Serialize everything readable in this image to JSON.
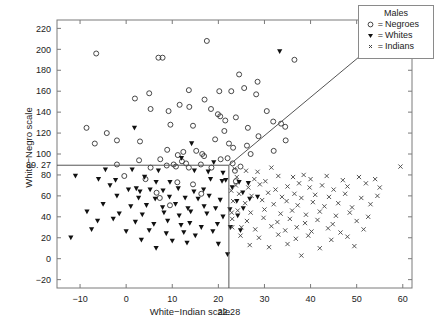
{
  "figure": {
    "axis": {
      "x": {
        "label": "White−Indian scale",
        "min": -15,
        "max": 62,
        "ticks": [
          -10,
          0,
          10,
          20,
          30,
          40,
          50,
          60
        ],
        "tick_labels": [
          "−10",
          "0",
          "10",
          "20",
          "30",
          "40",
          "50",
          "60"
        ],
        "special_tick": 22.28,
        "special_tick_label": "22.28"
      },
      "y": {
        "label": "White−Negro scale",
        "min": -28,
        "max": 228,
        "ticks": [
          -20,
          0,
          20,
          40,
          60,
          80,
          100,
          120,
          140,
          160,
          180,
          200,
          220
        ],
        "tick_labels": [
          "−20",
          "0",
          "20",
          "40",
          "60",
          "80",
          "100",
          "120",
          "140",
          "160",
          "180",
          "200",
          "220"
        ],
        "special_tick": 89.27,
        "special_tick_label": "89. 27"
      },
      "grid": false
    },
    "legend": {
      "title": "Males",
      "position": "top-right",
      "entries": [
        {
          "marker": "circle-open-marker",
          "eq": "=",
          "label": "Negroes"
        },
        {
          "marker": "triangle-down-filled-marker",
          "eq": "=",
          "label": "Whites"
        },
        {
          "marker": "x-cross-marker",
          "eq": "=",
          "label": "Indians"
        }
      ]
    },
    "boundaries": {
      "horizontal_line_y": 89.27,
      "horizontal_line_x_end": 22.28,
      "vertical_line_x": 22.28,
      "vertical_line_y_end": 89.27,
      "diagonal_line": {
        "x1": 22.28,
        "y1": 89.27,
        "x2": 58.5,
        "y2": 222
      },
      "color": "#555555"
    }
  },
  "chart_data": {
    "type": "scatter",
    "title": "",
    "xlabel": "White−Indian scale",
    "ylabel": "White−Negro scale",
    "xlim": [
      -15,
      62
    ],
    "ylim": [
      -28,
      228
    ],
    "legend_title": "Males",
    "series": [
      {
        "name": "Negroes",
        "marker": "circle-open-marker",
        "color": "#333333",
        "points": [
          [
            17.5,
            208
          ],
          [
            -6.5,
            196
          ],
          [
            7.0,
            192
          ],
          [
            7.9,
            192
          ],
          [
            24.5,
            176
          ],
          [
            28.5,
            169
          ],
          [
            36.5,
            190
          ],
          [
            25.6,
            163
          ],
          [
            13.6,
            161
          ],
          [
            20.2,
            160
          ],
          [
            22.8,
            160
          ],
          [
            28.2,
            157
          ],
          [
            1.9,
            153
          ],
          [
            5.0,
            158
          ],
          [
            17.0,
            152
          ],
          [
            11.6,
            147
          ],
          [
            13.7,
            145
          ],
          [
            5.3,
            143
          ],
          [
            9.2,
            141
          ],
          [
            18.4,
            143
          ],
          [
            30.5,
            141
          ],
          [
            23.8,
            135
          ],
          [
            21.5,
            132
          ],
          [
            19.9,
            138
          ],
          [
            20.4,
            136
          ],
          [
            -8.6,
            125
          ],
          [
            14.5,
            127
          ],
          [
            9.6,
            128
          ],
          [
            -4.2,
            120
          ],
          [
            -2.0,
            113
          ],
          [
            26.4,
            125
          ],
          [
            31.9,
            131
          ],
          [
            33.6,
            129
          ],
          [
            34.5,
            126
          ],
          [
            21.3,
            122
          ],
          [
            28.7,
            117
          ],
          [
            -6.8,
            110
          ],
          [
            3.0,
            112
          ],
          [
            19.3,
            114
          ],
          [
            22.3,
            110
          ],
          [
            23.2,
            106
          ],
          [
            26.2,
            108
          ],
          [
            34.6,
            113
          ],
          [
            8.9,
            104
          ],
          [
            12.4,
            102
          ],
          [
            15.2,
            103
          ],
          [
            11.2,
            99
          ],
          [
            16.5,
            100
          ],
          [
            16.9,
            98
          ],
          [
            27.0,
            100
          ],
          [
            32.0,
            103
          ],
          [
            22.0,
            96
          ],
          [
            2.8,
            94
          ],
          [
            7.4,
            95
          ],
          [
            12.1,
            93
          ],
          [
            13.0,
            91
          ],
          [
            20.5,
            95
          ],
          [
            -2.0,
            90
          ],
          [
            8.8,
            89
          ],
          [
            10.3,
            90
          ],
          [
            10.8,
            88
          ],
          [
            16.2,
            90
          ],
          [
            5.3,
            87
          ],
          [
            13.6,
            87
          ],
          [
            18.5,
            87
          ],
          [
            23.1,
            91
          ],
          [
            24.8,
            88
          ],
          [
            -0.4,
            79
          ],
          [
            4.2,
            76
          ],
          [
            11.1,
            73
          ],
          [
            14.5,
            71
          ],
          [
            6.6,
            63
          ],
          [
            16.3,
            62
          ],
          [
            23.6,
            84
          ],
          [
            7.3,
            58
          ],
          [
            9.5,
            51
          ],
          [
            23.8,
            74
          ]
        ]
      },
      {
        "name": "Whites",
        "marker": "triangle-down-filled-marker",
        "color": "#111111",
        "points": [
          [
            33.3,
            198
          ],
          [
            1.8,
            125
          ],
          [
            14.2,
            110
          ],
          [
            12.0,
            96
          ],
          [
            19.0,
            92
          ],
          [
            -4.5,
            85
          ],
          [
            1.3,
            85
          ],
          [
            7.0,
            84
          ],
          [
            14.8,
            84
          ],
          [
            17.8,
            83
          ],
          [
            21.0,
            82
          ],
          [
            -11.0,
            79
          ],
          [
            -6.0,
            76
          ],
          [
            -2.3,
            75
          ],
          [
            4.0,
            78
          ],
          [
            6.5,
            73
          ],
          [
            9.5,
            73
          ],
          [
            18.3,
            76
          ],
          [
            20.8,
            74
          ],
          [
            21.6,
            75
          ],
          [
            24.5,
            73
          ],
          [
            26.5,
            72
          ],
          [
            -3.5,
            70
          ],
          [
            0.5,
            66
          ],
          [
            2.2,
            67
          ],
          [
            3.0,
            64
          ],
          [
            5.2,
            66
          ],
          [
            8.0,
            65
          ],
          [
            11.3,
            67
          ],
          [
            14.7,
            64
          ],
          [
            16.8,
            66
          ],
          [
            23.0,
            68
          ],
          [
            25.3,
            63
          ],
          [
            -2.0,
            60
          ],
          [
            2.7,
            58
          ],
          [
            6.3,
            57
          ],
          [
            9.4,
            59
          ],
          [
            12.8,
            58
          ],
          [
            15.6,
            57
          ],
          [
            18.0,
            60
          ],
          [
            20.4,
            56
          ],
          [
            24.0,
            55
          ],
          [
            26.8,
            57
          ],
          [
            28.5,
            59
          ],
          [
            -5.0,
            52
          ],
          [
            1.0,
            50
          ],
          [
            4.4,
            51
          ],
          [
            7.9,
            49
          ],
          [
            10.7,
            52
          ],
          [
            13.4,
            48
          ],
          [
            16.9,
            50
          ],
          [
            19.4,
            48
          ],
          [
            22.5,
            47
          ],
          [
            25.4,
            48
          ],
          [
            -8.5,
            45
          ],
          [
            -1.5,
            43
          ],
          [
            3.5,
            42
          ],
          [
            8.2,
            44
          ],
          [
            11.5,
            41
          ],
          [
            14.0,
            45
          ],
          [
            17.5,
            43
          ],
          [
            21.0,
            40
          ],
          [
            24.2,
            41
          ],
          [
            -6.2,
            36
          ],
          [
            -2.8,
            38
          ],
          [
            2.0,
            35
          ],
          [
            6.0,
            33
          ],
          [
            9.0,
            36
          ],
          [
            11.9,
            32
          ],
          [
            13.8,
            34
          ],
          [
            16.3,
            30
          ],
          [
            19.8,
            33
          ],
          [
            22.6,
            30
          ],
          [
            -7.5,
            28
          ],
          [
            0.0,
            26
          ],
          [
            5.0,
            27
          ],
          [
            8.7,
            24
          ],
          [
            12.5,
            25
          ],
          [
            15.0,
            22
          ],
          [
            18.8,
            26
          ],
          [
            24.8,
            27
          ],
          [
            3.3,
            18
          ],
          [
            10.0,
            17
          ],
          [
            13.2,
            15
          ],
          [
            20.0,
            14
          ],
          [
            -12.0,
            20
          ],
          [
            6.5,
            10
          ],
          [
            22.0,
            4
          ]
        ]
      },
      {
        "name": "Indians",
        "marker": "x-cross-marker",
        "color": "#444444",
        "points": [
          [
            23.5,
            86
          ],
          [
            26.0,
            84
          ],
          [
            28.5,
            83
          ],
          [
            31.5,
            87
          ],
          [
            24.0,
            78
          ],
          [
            27.8,
            76
          ],
          [
            30.2,
            74
          ],
          [
            33.0,
            79
          ],
          [
            36.2,
            78
          ],
          [
            38.5,
            80
          ],
          [
            40.0,
            76
          ],
          [
            43.5,
            79
          ],
          [
            47.0,
            75
          ],
          [
            50.5,
            78
          ],
          [
            54.0,
            76
          ],
          [
            59.5,
            88
          ],
          [
            23.8,
            70
          ],
          [
            26.5,
            68
          ],
          [
            29.0,
            71
          ],
          [
            32.4,
            66
          ],
          [
            35.0,
            69
          ],
          [
            37.5,
            72
          ],
          [
            39.8,
            68
          ],
          [
            42.5,
            70
          ],
          [
            45.0,
            66
          ],
          [
            48.0,
            69
          ],
          [
            52.0,
            72
          ],
          [
            55.0,
            68
          ],
          [
            24.5,
            62
          ],
          [
            27.2,
            60
          ],
          [
            30.8,
            63
          ],
          [
            33.8,
            59
          ],
          [
            36.5,
            62
          ],
          [
            38.0,
            58
          ],
          [
            41.0,
            61
          ],
          [
            44.0,
            59
          ],
          [
            47.5,
            62
          ],
          [
            51.0,
            58
          ],
          [
            54.5,
            60
          ],
          [
            23.2,
            55
          ],
          [
            25.8,
            53
          ],
          [
            29.5,
            56
          ],
          [
            32.0,
            52
          ],
          [
            34.8,
            55
          ],
          [
            37.2,
            51
          ],
          [
            40.5,
            54
          ],
          [
            43.0,
            50
          ],
          [
            46.0,
            53
          ],
          [
            49.0,
            49
          ],
          [
            53.0,
            52
          ],
          [
            24.2,
            46
          ],
          [
            27.0,
            44
          ],
          [
            30.0,
            47
          ],
          [
            33.5,
            43
          ],
          [
            36.0,
            46
          ],
          [
            39.0,
            42
          ],
          [
            42.0,
            45
          ],
          [
            45.5,
            41
          ],
          [
            48.5,
            44
          ],
          [
            52.5,
            40
          ],
          [
            23.0,
            38
          ],
          [
            26.2,
            36
          ],
          [
            29.8,
            39
          ],
          [
            32.8,
            35
          ],
          [
            35.5,
            38
          ],
          [
            38.8,
            34
          ],
          [
            41.5,
            37
          ],
          [
            44.8,
            33
          ],
          [
            50.0,
            36
          ],
          [
            25.0,
            30
          ],
          [
            28.0,
            28
          ],
          [
            31.5,
            31
          ],
          [
            34.5,
            27
          ],
          [
            37.0,
            30
          ],
          [
            40.2,
            26
          ],
          [
            43.8,
            29
          ],
          [
            46.5,
            25
          ],
          [
            51.5,
            28
          ],
          [
            24.8,
            22
          ],
          [
            28.8,
            20
          ],
          [
            33.0,
            23
          ],
          [
            36.8,
            19
          ],
          [
            39.5,
            22
          ],
          [
            44.5,
            18
          ],
          [
            48.0,
            21
          ],
          [
            26.8,
            13
          ],
          [
            31.0,
            11
          ],
          [
            35.0,
            14
          ],
          [
            42.0,
            10
          ],
          [
            49.5,
            12
          ],
          [
            38.0,
            3
          ],
          [
            23.0,
            30
          ],
          [
            22.8,
            65
          ],
          [
            22.9,
            44
          ]
        ]
      }
    ]
  }
}
